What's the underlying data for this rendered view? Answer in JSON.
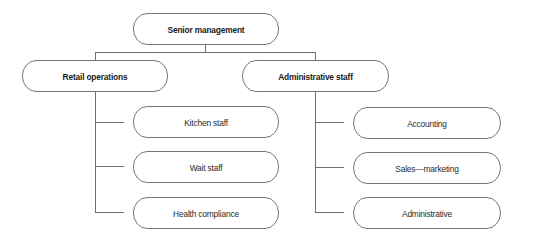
{
  "diagram": {
    "type": "org-chart",
    "line_color": "#6e6e6e",
    "root": {
      "label": "Senior management"
    },
    "departments": [
      {
        "label": "Retail operations",
        "children": [
          {
            "label": "Kitchen staff"
          },
          {
            "label": "Wait staff"
          },
          {
            "label": "Health compliance"
          }
        ]
      },
      {
        "label": "Administrative staff",
        "children": [
          {
            "label": "Accounting"
          },
          {
            "label": "Sales—marketing"
          },
          {
            "label": "Administrative"
          }
        ]
      }
    ]
  }
}
